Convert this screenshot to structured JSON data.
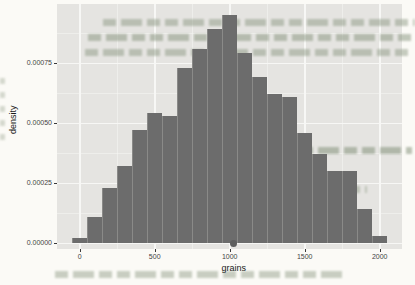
{
  "page": {
    "background": "#fbfaf6",
    "description_colors": {
      "page_bg": "#fbfaf6",
      "bleed_text": "#7d8c73"
    }
  },
  "chart_data": {
    "type": "bar",
    "subtype": "histogram",
    "title": "",
    "xlabel": "grains",
    "ylabel": "density",
    "bin_width": 100,
    "bin_centers": [
      0,
      100,
      200,
      300,
      400,
      500,
      600,
      700,
      800,
      900,
      1000,
      1100,
      1200,
      1300,
      1400,
      1500,
      1600,
      1700,
      1800,
      1900,
      2000
    ],
    "densities": [
      2e-05,
      0.00011,
      0.00023,
      0.00032,
      0.00047,
      0.00054,
      0.00053,
      0.00073,
      0.00081,
      0.00089,
      0.00095,
      0.00079,
      0.00069,
      0.00062,
      0.00061,
      0.00046,
      0.00037,
      0.0003,
      0.0003,
      0.00014,
      3e-05
    ],
    "x_ticks": {
      "values": [
        0,
        500,
        1000,
        1500,
        2000
      ],
      "labels": [
        "0",
        "500",
        "1000",
        "1500",
        "2000"
      ]
    },
    "y_ticks": {
      "values": [
        0,
        0.00025,
        0.0005,
        0.00075
      ],
      "labels": [
        "0.00000",
        "0.00025",
        "0.00050",
        "0.00075"
      ]
    },
    "xlim": [
      -155,
      2155
    ],
    "ylim": [
      0,
      0.001
    ],
    "point_marker": {
      "x": 1025,
      "y": 0
    },
    "grid": "on",
    "legend": "none",
    "colors": {
      "bar_fill": "#6c6c6c",
      "panel_bg": "#e5e4e1",
      "grid_major": "#f7f7f5",
      "axis_text": "#444444",
      "axis_title": "#1a1a1a",
      "point": "#5e5e5e",
      "tick_mark": "#3a3a3a"
    }
  }
}
